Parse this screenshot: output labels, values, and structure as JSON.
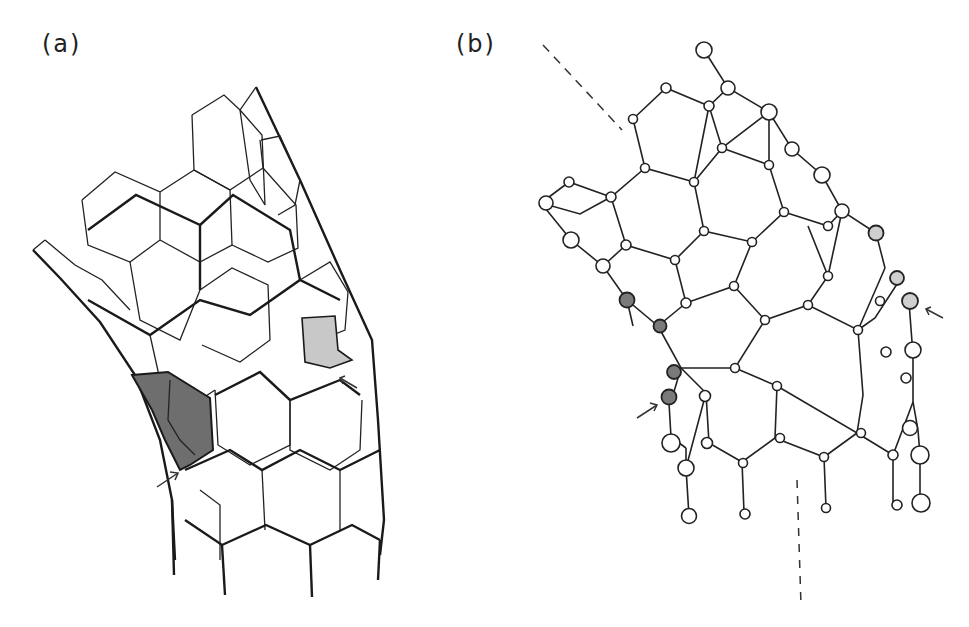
{
  "figure": {
    "panels": [
      {
        "id": "a",
        "label": "(a)",
        "description": "Perspective line drawing of a curved hexagonal (graphene-like) tube wall; one dark-shaded heptagon region and one light-shaded pentagon indicated by arrows"
      },
      {
        "id": "b",
        "label": "(b)",
        "description": "Ball-and-stick hexagonal network viewed edge-on; dark-shaded and light-shaded atoms marked by arrows; dashed lines indicate axes"
      }
    ],
    "colors": {
      "line": "#222222",
      "dark_shade": "#7a7a7a",
      "light_shade": "#cfcfcf",
      "background": "#ffffff"
    },
    "annotations": {
      "panel_a_arrows": 2,
      "panel_b_arrows": 2,
      "panel_b_dashed_lines": 2
    }
  }
}
